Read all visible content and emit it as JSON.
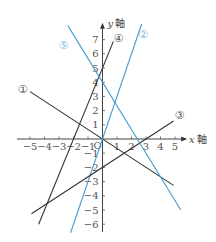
{
  "chart_data": {
    "type": "line",
    "title": "",
    "xlabel": "x 軸",
    "ylabel": "y 軸",
    "x_var": "x",
    "y_var": "y",
    "axis_word": "軸",
    "origin_label": "O",
    "xlim": [
      -5,
      5
    ],
    "ylim": [
      -6,
      7
    ],
    "x_ticks": [
      -5,
      -4,
      -3,
      -2,
      -1,
      1,
      2,
      3,
      4,
      5
    ],
    "y_ticks": [
      -6,
      -5,
      -4,
      -3,
      -2,
      -1,
      1,
      2,
      3,
      4,
      5,
      6,
      7
    ],
    "x_tick_labels": [
      "−5",
      "−4",
      "−3",
      "−2",
      "−1",
      "1",
      "2",
      "3",
      "4",
      "5"
    ],
    "y_tick_labels": [
      "−6",
      "−5",
      "−4",
      "−3",
      "−2",
      "−1",
      "1",
      "2",
      "3",
      "4",
      "5",
      "6",
      "7"
    ],
    "grid": false,
    "series": [
      {
        "name": "①",
        "equation": "y = -2/3 x",
        "slope": -0.6667,
        "intercept": 0,
        "x_range": [
          -5,
          4.9
        ],
        "color": "#333333",
        "label_pos": [
          -5.5,
          3.5
        ]
      },
      {
        "name": "②",
        "equation": "y = 3x",
        "slope": 3,
        "intercept": 0,
        "x_range": [
          -2.2,
          2.7
        ],
        "color": "#4a9bd1",
        "label_pos": [
          2.8,
          7.4
        ]
      },
      {
        "name": "③",
        "equation": "y = 2/3 x - 2",
        "slope": 0.6667,
        "intercept": -2,
        "x_range": [
          -4.9,
          4.9
        ],
        "color": "#333333",
        "label_pos": [
          5.3,
          1.7
        ]
      },
      {
        "name": "④",
        "equation": "y = 5/2 x + 5",
        "slope": 2.5,
        "intercept": 5,
        "x_range": [
          -4.4,
          0.75
        ],
        "color": "#333333",
        "label_pos": [
          1.1,
          7.1
        ]
      },
      {
        "name": "⑤",
        "equation": "y = -5/3 x + 4",
        "slope": -1.6667,
        "intercept": 4,
        "x_range": [
          -2.4,
          5.4
        ],
        "color": "#4a9bd1",
        "label_pos": [
          -2.7,
          6.6
        ]
      }
    ]
  },
  "axes": {
    "x_axis_var": "x",
    "y_axis_var": "y",
    "axis_word": "軸",
    "origin": "O"
  }
}
